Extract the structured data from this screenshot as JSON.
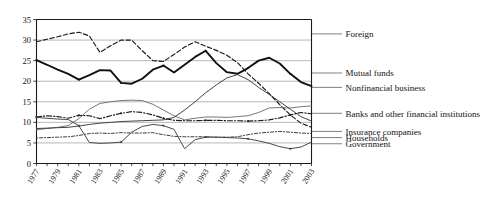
{
  "chart_data": {
    "type": "line",
    "title": "",
    "subtitle": "",
    "xlabel": "",
    "ylabel": "",
    "xlim": [
      1977,
      2003
    ],
    "ylim": [
      0,
      35
    ],
    "yticks": [
      0,
      5,
      10,
      15,
      20,
      25,
      30,
      35
    ],
    "grid": true,
    "legend_position": "right",
    "x": [
      1977,
      1978,
      1979,
      1980,
      1981,
      1982,
      1983,
      1984,
      1985,
      1986,
      1987,
      1988,
      1989,
      1990,
      1991,
      1992,
      1993,
      1994,
      1995,
      1996,
      1997,
      1998,
      1999,
      2000,
      2001,
      2002,
      2003
    ],
    "xtick_labels": [
      "1977",
      "1979",
      "1981",
      "1983",
      "1985",
      "1987",
      "1989",
      "1991",
      "1993",
      "1995",
      "1997",
      "1999",
      "2001",
      "2003"
    ],
    "series": [
      {
        "name": "Households",
        "style": "dashed-thin",
        "color": "#1a1a1a",
        "values": [
          29.6,
          30.2,
          30.8,
          31.5,
          31.9,
          31.0,
          27.0,
          28.6,
          30.0,
          30.0,
          27.4,
          25.0,
          24.8,
          26.5,
          28.3,
          29.6,
          28.5,
          27.5,
          26.3,
          24.5,
          21.8,
          19.5,
          17.0,
          14.3,
          11.8,
          9.8,
          8.8
        ]
      },
      {
        "name": "Foreign",
        "style": "solid-thick",
        "color": "#111111",
        "values": [
          25.1,
          24.0,
          22.8,
          21.8,
          20.4,
          21.5,
          22.7,
          22.6,
          19.6,
          19.4,
          20.6,
          22.8,
          23.8,
          22.1,
          24.0,
          25.9,
          27.4,
          24.4,
          22.2,
          21.8,
          23.2,
          25.0,
          25.7,
          24.3,
          21.8,
          19.8,
          18.8
        ]
      },
      {
        "name": "Mutual funds",
        "style": "solid-thin-gray",
        "color": "#6e6e6e",
        "values": [
          8.2,
          8.5,
          8.8,
          9.2,
          10.9,
          13.2,
          14.6,
          15.0,
          15.3,
          15.4,
          15.3,
          14.4,
          13.0,
          11.6,
          10.6,
          11.0,
          11.3,
          11.3,
          11.2,
          11.4,
          11.6,
          12.4,
          13.5,
          13.6,
          13.5,
          13.8,
          14.0
        ]
      },
      {
        "name": "Nonfinancial business",
        "style": "solid-thin-dark",
        "color": "#3a3a3a",
        "values": [
          8.5,
          8.6,
          8.7,
          8.8,
          9.1,
          9.5,
          9.8,
          10.0,
          10.2,
          10.3,
          10.4,
          10.5,
          10.6,
          11.2,
          13.0,
          15.0,
          17.2,
          19.1,
          20.8,
          21.6,
          20.4,
          18.5,
          16.8,
          15.0,
          13.2,
          11.4,
          10.3
        ]
      },
      {
        "name": "Banks and other financial institutions",
        "style": "dash-dot",
        "color": "#1a1a1a",
        "values": [
          11.3,
          11.6,
          11.4,
          11.0,
          11.7,
          11.6,
          10.9,
          11.6,
          12.2,
          12.6,
          12.4,
          11.8,
          11.0,
          10.5,
          10.4,
          10.4,
          10.5,
          10.5,
          10.4,
          10.4,
          10.3,
          10.4,
          10.6,
          11.1,
          11.8,
          12.4,
          12.1
        ]
      },
      {
        "name": "Insurance companies",
        "style": "dotted-dash",
        "color": "#333333",
        "values": [
          6.2,
          6.3,
          6.4,
          6.5,
          6.8,
          7.3,
          7.4,
          7.3,
          7.5,
          7.4,
          7.4,
          7.5,
          7.0,
          6.6,
          6.5,
          6.5,
          6.5,
          6.4,
          6.4,
          6.5,
          7.0,
          7.4,
          7.6,
          7.8,
          7.6,
          7.4,
          7.3
        ]
      },
      {
        "name": "Government",
        "style": "solid-thin-markers",
        "color": "#3f3f3f",
        "values": [
          11.2,
          11.0,
          10.8,
          10.7,
          9.2,
          5.1,
          4.9,
          5.0,
          5.2,
          7.6,
          9.0,
          9.5,
          9.2,
          8.3,
          3.6,
          5.8,
          6.4,
          6.4,
          6.3,
          6.2,
          6.0,
          5.5,
          4.9,
          4.1,
          3.6,
          4.0,
          5.2
        ]
      }
    ],
    "legend_entries": [
      {
        "label": "Foreign",
        "y_value": 31.5
      },
      {
        "label": "Mutual funds",
        "y_value": 22.0
      },
      {
        "label": "Nonfinancial business",
        "y_value": 18.5
      },
      {
        "label": "Banks and other financial institutions",
        "y_value": 12.2
      },
      {
        "label": "Insurance companies",
        "y_value": 7.8
      },
      {
        "label": "Households",
        "y_value": 6.3
      },
      {
        "label": "Government",
        "y_value": 4.8
      }
    ]
  }
}
